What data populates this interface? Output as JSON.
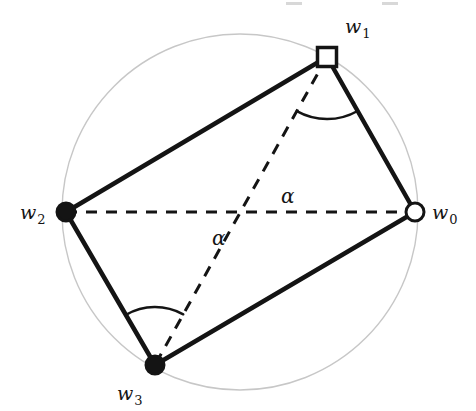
{
  "figure": {
    "type": "geometry-diagram",
    "background_color": "#ffffff",
    "circle": {
      "name": "circumscribed-circle",
      "center_x": 240,
      "center_y": 212,
      "radius": 178,
      "stroke_color": "#c7c7c7",
      "stroke_width": 1.4,
      "fill": "none"
    },
    "vertices": [
      {
        "id": "w0",
        "label": "w",
        "subscript": "0",
        "x": 415,
        "y": 212,
        "marker": "open-circle",
        "marker_radius": 9,
        "fill_color": "#ffffff",
        "stroke_color": "#141414",
        "label_x": 432,
        "label_y": 219
      },
      {
        "id": "w1",
        "label": "w",
        "subscript": "1",
        "x": 327,
        "y": 57,
        "marker": "open-square",
        "marker_size": 19,
        "fill_color": "#ffffff",
        "stroke_color": "#141414",
        "label_x": 345,
        "label_y": 33
      },
      {
        "id": "w2",
        "label": "w",
        "subscript": "2",
        "x": 66,
        "y": 212,
        "marker": "filled-circle",
        "marker_radius": 9,
        "fill_color": "#141414",
        "stroke_color": "#141414",
        "label_x": 20,
        "label_y": 219
      },
      {
        "id": "w3",
        "label": "w",
        "subscript": "3",
        "x": 155,
        "y": 365,
        "marker": "filled-circle",
        "marker_radius": 9,
        "fill_color": "#141414",
        "stroke_color": "#141414",
        "label_x": 117,
        "label_y": 400
      }
    ],
    "solid_edges": [
      {
        "name": "edge-w2-w1",
        "from": "w2",
        "to": "w1",
        "stroke_color": "#141414",
        "stroke_width": 4.5
      },
      {
        "name": "edge-w1-w0",
        "from": "w1",
        "to": "w0",
        "stroke_color": "#141414",
        "stroke_width": 4.5
      },
      {
        "name": "edge-w0-w3",
        "from": "w0",
        "to": "w3",
        "stroke_color": "#141414",
        "stroke_width": 4.5
      },
      {
        "name": "edge-w3-w2",
        "from": "w3",
        "to": "w2",
        "stroke_color": "#141414",
        "stroke_width": 4.5
      }
    ],
    "dashed_edges": [
      {
        "name": "diagonal-w2-w0",
        "from": "w2",
        "to": "w0",
        "stroke_color": "#141414",
        "stroke_width": 3,
        "dash": "11,9"
      },
      {
        "name": "diagonal-w1-w3",
        "from": "w1",
        "to": "w3",
        "stroke_color": "#141414",
        "stroke_width": 3,
        "dash": "11,9"
      }
    ],
    "angle_arcs": [
      {
        "name": "angle-alpha-upper",
        "label": "α",
        "vertex": "w1",
        "between": [
          "diagonal-w1-w3",
          "diagonal-w2-w0"
        ],
        "arc_radius": 62,
        "stroke_color": "#141414",
        "stroke_width": 2.4,
        "label_x": 281,
        "label_y": 203
      },
      {
        "name": "angle-alpha-lower",
        "label": "α",
        "vertex": "w3",
        "between": [
          "diagonal-w2-w0",
          "diagonal-w1-w3"
        ],
        "arc_radius": 58,
        "stroke_color": "#141414",
        "stroke_width": 2.4,
        "label_x": 212,
        "label_y": 245
      }
    ],
    "intersection": {
      "name": "diagonal-intersection",
      "x": 245,
      "y": 212
    },
    "scan_artifacts": [
      {
        "name": "scan-artifact-left",
        "x": 286,
        "y": 2,
        "width": 16,
        "height": 3,
        "color": "#d8d8d8"
      },
      {
        "name": "scan-artifact-right",
        "x": 382,
        "y": 2,
        "width": 16,
        "height": 3,
        "color": "#d8d8d8"
      }
    ]
  }
}
